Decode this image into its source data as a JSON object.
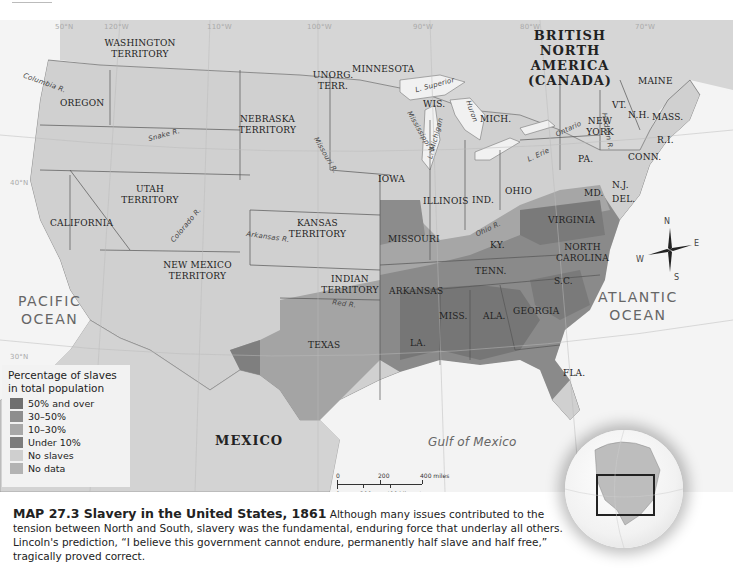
{
  "header": {
    "running_head": "The United States, 1850–1877",
    "page_number": "533"
  },
  "map": {
    "grid_labels": [
      "50°N",
      "120°W",
      "110°W",
      "100°W",
      "90°W",
      "80°W",
      "70°W",
      "40°N",
      "30°N"
    ],
    "regions": {
      "british_north_america": "BRITISH\nNORTH AMERICA\n(CANADA)",
      "mexico": "MEXICO",
      "washington": "WASHINGTON\nTERRITORY",
      "oregon": "OREGON",
      "california": "CALIFORNIA",
      "utah": "UTAH\nTERRITORY",
      "new_mexico": "NEW MEXICO\nTERRITORY",
      "nebraska": "NEBRASKA\nTERRITORY",
      "unorg": "UNORG.\nTERR.",
      "minnesota": "MINNESOTA",
      "kansas": "KANSAS\nTERRITORY",
      "indian": "INDIAN\nTERRITORY",
      "texas": "TEXAS",
      "iowa": "IOWA",
      "missouri": "MISSOURI",
      "arkansas": "ARKANSAS",
      "la": "LA.",
      "wis": "WIS.",
      "illinois": "ILLINOIS",
      "mich": "MICH.",
      "ind": "IND.",
      "ohio": "OHIO",
      "ky": "KY.",
      "tenn": "TENN.",
      "miss": "MISS.",
      "ala": "ALA.",
      "georgia": "GEORGIA",
      "fla": "FLA.",
      "sc": "S.C.",
      "nc": "NORTH\nCAROLINA",
      "virginia": "VIRGINIA",
      "md": "MD.",
      "del": "DEL.",
      "nj": "N.J.",
      "pa": "PA.",
      "ny": "NEW\nYORK",
      "conn": "CONN.",
      "ri": "R.I.",
      "mass": "MASS.",
      "vt": "VT.",
      "nh": "N.H.",
      "maine": "MAINE"
    },
    "water": {
      "pacific": "PACIFIC\nOCEAN",
      "atlantic": "ATLANTIC\nOCEAN",
      "gulf": "Gulf of Mexico",
      "superior": "L. Superior",
      "michigan": "L. Michigan",
      "huron": "Huron",
      "erie": "L. Erie",
      "ontario": "Ontario"
    },
    "rivers": {
      "columbia": "Columbia R.",
      "snake": "Snake R.",
      "missouri": "Missouri R.",
      "mississippi": "Mississippi R.",
      "colorado": "Colorado R.",
      "arkansas": "Arkansas R.",
      "red": "Red R.",
      "ohio": "Ohio R.",
      "hudson": "Hudson R."
    },
    "compass": {
      "n": "N",
      "s": "S",
      "e": "E",
      "w": "W"
    },
    "scale": {
      "miles_labels": [
        "0",
        "200",
        "400 miles"
      ],
      "km_labels": [
        "0",
        "200",
        "400 kilometers"
      ]
    }
  },
  "legend": {
    "title": "Percentage of slaves in total population",
    "items": [
      {
        "label": "50% and over",
        "color": "#6f6f6f"
      },
      {
        "label": "30–50%",
        "color": "#8e8e8e"
      },
      {
        "label": "10–30%",
        "color": "#a8a8a8"
      },
      {
        "label": "Under 10%",
        "color": "#7c7c7c"
      },
      {
        "label": "No slaves",
        "color": "#cfcfcf"
      },
      {
        "label": "No data",
        "color": "#b3b3b3"
      }
    ]
  },
  "caption": {
    "title": "MAP 27.3 Slavery in the United States, 1861",
    "body": "Although many issues contributed to the tension between North and South, slavery was the fundamental, enduring force that underlay all others. Lincoln's prediction, “I believe this government cannot endure, permanently half slave and half free,” tragically proved correct."
  },
  "colors": {
    "land": "#d4d4d4",
    "free_state": "#cdcdcd",
    "water": "#f3f3f3",
    "border": "#555555"
  }
}
